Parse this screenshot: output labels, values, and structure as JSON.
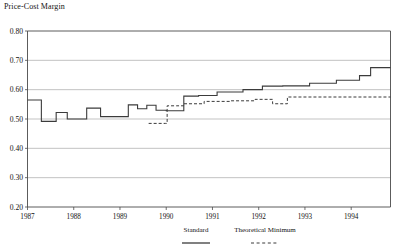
{
  "chart_data": {
    "type": "line",
    "title": "Price-Cost Margin",
    "xlabel": "",
    "ylabel": "",
    "ylim": [
      0.2,
      0.8
    ],
    "ytick_values": [
      0.2,
      0.3,
      0.4,
      0.5,
      0.6,
      0.7,
      0.8
    ],
    "ytick_labels": [
      "0.20",
      "0.30",
      "0.40",
      "0.50",
      "0.60",
      "0.70",
      "0.80"
    ],
    "xlim": [
      1987.0,
      1994.85
    ],
    "xtick_values": [
      1987,
      1988,
      1989,
      1990,
      1991,
      1992,
      1993,
      1994
    ],
    "xtick_labels": [
      "1987",
      "1988",
      "1989",
      "1990",
      "1991",
      "1992",
      "1993",
      "1994"
    ],
    "grid": true,
    "grid_axis": "y",
    "legend_position": "bottom-right",
    "line_color": "#3b3b3b",
    "grid_color": "#9a9a9a",
    "axis_color": "#4a4a4a",
    "series": [
      {
        "name": "Standard",
        "style": "solid",
        "step": true,
        "x": [
          1987.0,
          1987.18,
          1987.3,
          1987.55,
          1987.62,
          1987.78,
          1987.86,
          1988.2,
          1988.28,
          1988.48,
          1988.58,
          1989.1,
          1989.18,
          1989.3,
          1989.38,
          1989.48,
          1989.58,
          1989.68,
          1989.78,
          1989.92,
          1990.0,
          1990.18,
          1990.38,
          1990.52,
          1990.7,
          1990.88,
          1991.1,
          1991.42,
          1991.66,
          1991.88,
          1992.08,
          1992.3,
          1992.52,
          1992.8,
          1993.1,
          1993.42,
          1993.68,
          1993.92,
          1994.18,
          1994.42,
          1994.85
        ],
        "y": [
          0.565,
          0.565,
          0.492,
          0.492,
          0.522,
          0.522,
          0.5,
          0.5,
          0.537,
          0.537,
          0.508,
          0.508,
          0.548,
          0.548,
          0.535,
          0.535,
          0.547,
          0.547,
          0.53,
          0.53,
          0.528,
          0.528,
          0.578,
          0.578,
          0.58,
          0.58,
          0.592,
          0.592,
          0.6,
          0.6,
          0.612,
          0.612,
          0.613,
          0.613,
          0.622,
          0.622,
          0.632,
          0.632,
          0.648,
          0.675,
          0.675
        ]
      },
      {
        "name": "Theoretical Minimum",
        "style": "dashed",
        "step": true,
        "x": [
          1989.62,
          1989.98,
          1990.02,
          1990.22,
          1990.38,
          1990.6,
          1990.82,
          1991.08,
          1991.4,
          1991.66,
          1991.92,
          1992.12,
          1992.3,
          1992.46,
          1992.62,
          1994.85
        ],
        "y": [
          0.485,
          0.485,
          0.545,
          0.545,
          0.552,
          0.552,
          0.56,
          0.56,
          0.562,
          0.562,
          0.567,
          0.567,
          0.552,
          0.552,
          0.575,
          0.575
        ]
      }
    ],
    "legend": [
      {
        "label": "Standard",
        "style": "solid"
      },
      {
        "label": "Theoretical Minimum",
        "style": "dashed"
      }
    ]
  }
}
